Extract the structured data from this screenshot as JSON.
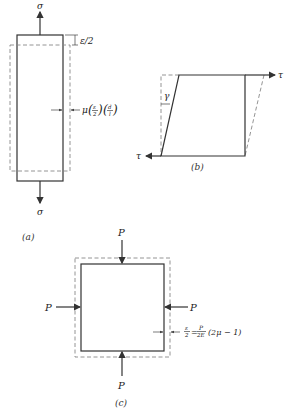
{
  "figure_a": {
    "caption": "(a)",
    "top_load_label": "σ",
    "bottom_load_label": "σ",
    "elongation_label": "ε/2",
    "lateral_contraction_prefix": "μ",
    "lateral_frac1_num": "ε",
    "lateral_frac1_den": "2",
    "lateral_frac2_num": "d",
    "lateral_frac2_den": "l"
  },
  "figure_b": {
    "caption": "(b)",
    "top_shear_label": "τ",
    "bottom_shear_label": "τ",
    "shear_angle_label": "γ"
  },
  "figure_c": {
    "caption": "(c)",
    "load_top": "P",
    "load_bottom": "P",
    "load_left": "P",
    "load_right": "P",
    "strain_frac_num": "ε",
    "strain_frac_den": "2",
    "equals": "=",
    "rhs_frac_num": "P",
    "rhs_frac_den": "2E",
    "rhs_tail": "(2μ − 1)"
  }
}
